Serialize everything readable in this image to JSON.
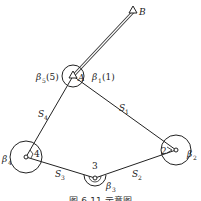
{
  "diagram": {
    "type": "closed traverse survey diagram",
    "points": {
      "B": {
        "label": "B",
        "x": 133,
        "y": 12,
        "symbol": "triangle"
      },
      "A": {
        "label": "A",
        "x": 73,
        "y": 76,
        "symbol": "triangle"
      },
      "p1": {
        "label": "2",
        "x": 176,
        "y": 150
      },
      "p3": {
        "label": "3",
        "x": 95,
        "y": 178
      },
      "p4": {
        "label": "4",
        "x": 26,
        "y": 157
      }
    },
    "sides": [
      {
        "label": "S",
        "sub": "1",
        "from": "A",
        "to": "2"
      },
      {
        "label": "S",
        "sub": "2",
        "from": "2",
        "to": "3"
      },
      {
        "label": "S",
        "sub": "3",
        "from": "3",
        "to": "4"
      },
      {
        "label": "S",
        "sub": "4",
        "from": "4",
        "to": "A"
      }
    ],
    "angles": [
      {
        "label": "β",
        "sub": "5",
        "suffix": "(5)",
        "at": "A"
      },
      {
        "label": "β",
        "sub": "1",
        "suffix": "(1)",
        "at": "A"
      },
      {
        "label": "β",
        "sub": "2",
        "suffix": "",
        "at": "2"
      },
      {
        "label": "β",
        "sub": "3",
        "suffix": "",
        "at": "3"
      },
      {
        "label": "β",
        "sub": "4",
        "suffix": "",
        "at": "4"
      }
    ],
    "text": {
      "B": "B",
      "A": "A",
      "n2": "2",
      "n3": "3",
      "n4": "4",
      "beta": "β",
      "S": "S",
      "s1": "1",
      "s2": "2",
      "s3": "3",
      "s4": "4",
      "b1": "1",
      "b2": "2",
      "b3": "3",
      "b4": "4",
      "b5": "5",
      "b5_suffix": "(5)",
      "b1_suffix": "(1)"
    },
    "caption": "图 6-11  示意图"
  }
}
